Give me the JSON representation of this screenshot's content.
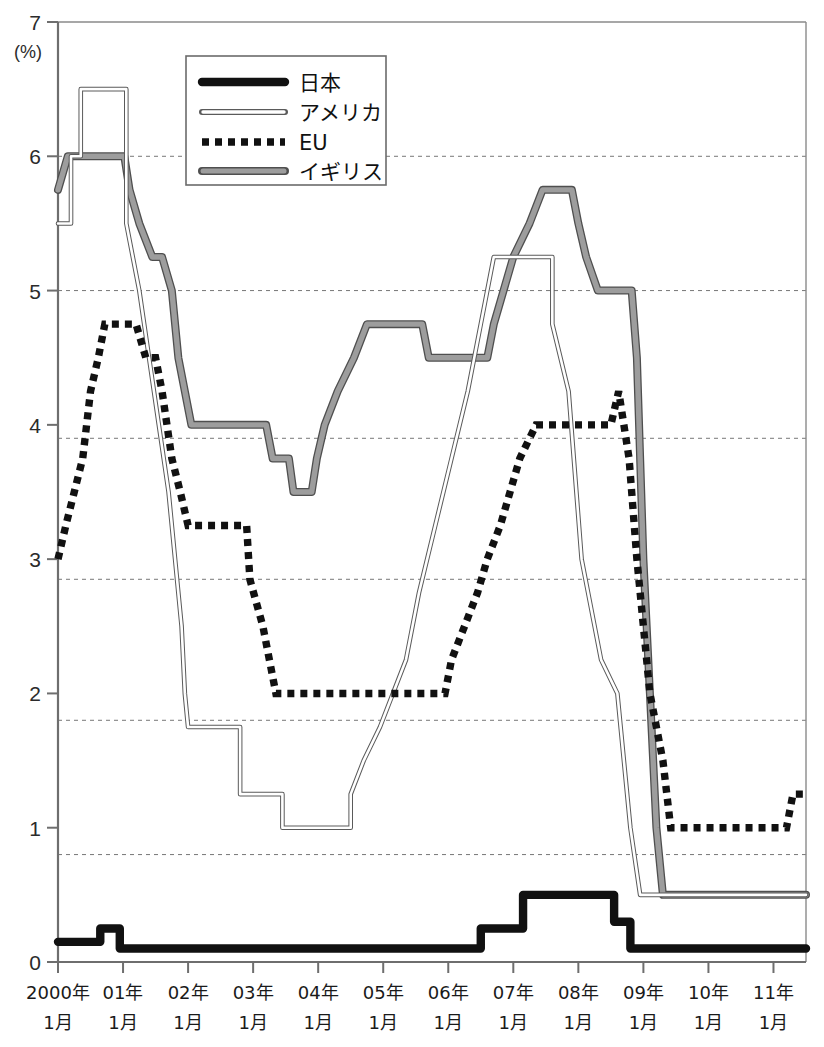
{
  "chart_data": {
    "type": "line",
    "title": "",
    "subtitle": "",
    "xlabel": "",
    "ylabel": "",
    "unit_label": "(%)",
    "ylim": [
      0,
      7
    ],
    "yticks": [
      0,
      1,
      2,
      3,
      4,
      5,
      6,
      7
    ],
    "ytick_labels": [
      "0",
      "1",
      "2",
      "3",
      "4",
      "5",
      "6",
      "7"
    ],
    "grid": "horizontal dashed at 0.8, 1.8, 2.85, 3.9, 5.0, 6.0",
    "gridlines": [
      0.8,
      1.8,
      2.85,
      3.9,
      5.0,
      6.0
    ],
    "legend_position": "top-center-left",
    "xlim": [
      2000.0,
      2011.5
    ],
    "xticks": [
      2000,
      2001,
      2002,
      2003,
      2004,
      2005,
      2006,
      2007,
      2008,
      2009,
      2010,
      2011
    ],
    "categories": [
      "2000年\n1月",
      "01年\n1月",
      "02年\n1月",
      "03年\n1月",
      "04年\n1月",
      "05年\n1月",
      "06年\n1月",
      "07年\n1月",
      "08年\n1月",
      "09年\n1月",
      "10年\n1月",
      "11年\n1月"
    ],
    "xtick_labels_line1": [
      "2000年",
      "01年",
      "02年",
      "03年",
      "04年",
      "05年",
      "06年",
      "07年",
      "08年",
      "09年",
      "10年",
      "11年"
    ],
    "xtick_labels_line2": [
      "1月",
      "1月",
      "1月",
      "1月",
      "1月",
      "1月",
      "1月",
      "1月",
      "1月",
      "1月",
      "1月",
      "1月"
    ],
    "series": [
      {
        "name": "日本",
        "style": "thick-black-solid",
        "color": "#1a1a1a",
        "points": [
          [
            2000.0,
            0.15
          ],
          [
            2000.65,
            0.15
          ],
          [
            2000.65,
            0.25
          ],
          [
            2000.95,
            0.25
          ],
          [
            2000.95,
            0.1
          ],
          [
            2006.5,
            0.1
          ],
          [
            2006.5,
            0.25
          ],
          [
            2007.15,
            0.25
          ],
          [
            2007.15,
            0.5
          ],
          [
            2008.55,
            0.5
          ],
          [
            2008.55,
            0.3
          ],
          [
            2008.8,
            0.3
          ],
          [
            2008.8,
            0.1
          ],
          [
            2011.5,
            0.1
          ]
        ]
      },
      {
        "name": "アメリカ",
        "style": "thin-outlined-white",
        "color": "#ffffff",
        "points": [
          [
            2000.0,
            5.5
          ],
          [
            2000.2,
            5.5
          ],
          [
            2000.2,
            6.0
          ],
          [
            2000.35,
            6.0
          ],
          [
            2000.35,
            6.5
          ],
          [
            2001.05,
            6.5
          ],
          [
            2001.05,
            5.5
          ],
          [
            2001.25,
            5.0
          ],
          [
            2001.4,
            4.5
          ],
          [
            2001.55,
            4.0
          ],
          [
            2001.7,
            3.5
          ],
          [
            2001.8,
            3.0
          ],
          [
            2001.9,
            2.5
          ],
          [
            2001.95,
            2.0
          ],
          [
            2002.0,
            1.75
          ],
          [
            2002.8,
            1.75
          ],
          [
            2002.8,
            1.25
          ],
          [
            2003.45,
            1.25
          ],
          [
            2003.45,
            1.0
          ],
          [
            2004.5,
            1.0
          ],
          [
            2004.5,
            1.25
          ],
          [
            2004.7,
            1.5
          ],
          [
            2004.95,
            1.75
          ],
          [
            2005.15,
            2.0
          ],
          [
            2005.35,
            2.25
          ],
          [
            2005.55,
            2.75
          ],
          [
            2005.8,
            3.25
          ],
          [
            2006.05,
            3.75
          ],
          [
            2006.3,
            4.25
          ],
          [
            2006.5,
            4.75
          ],
          [
            2006.7,
            5.25
          ],
          [
            2007.6,
            5.25
          ],
          [
            2007.6,
            4.75
          ],
          [
            2007.85,
            4.25
          ],
          [
            2008.05,
            3.0
          ],
          [
            2008.35,
            2.25
          ],
          [
            2008.6,
            2.0
          ],
          [
            2008.8,
            1.0
          ],
          [
            2008.95,
            0.5
          ],
          [
            2011.5,
            0.5
          ]
        ]
      },
      {
        "name": "EU",
        "style": "thick-black-dotted",
        "color": "#111111",
        "points": [
          [
            2000.0,
            3.0
          ],
          [
            2000.12,
            3.25
          ],
          [
            2000.25,
            3.5
          ],
          [
            2000.38,
            3.75
          ],
          [
            2000.5,
            4.25
          ],
          [
            2000.62,
            4.5
          ],
          [
            2000.72,
            4.75
          ],
          [
            2001.2,
            4.75
          ],
          [
            2001.35,
            4.5
          ],
          [
            2001.5,
            4.5
          ],
          [
            2001.6,
            4.25
          ],
          [
            2001.75,
            3.75
          ],
          [
            2001.88,
            3.5
          ],
          [
            2002.0,
            3.25
          ],
          [
            2002.9,
            3.25
          ],
          [
            2002.95,
            2.85
          ],
          [
            2003.15,
            2.5
          ],
          [
            2003.35,
            2.0
          ],
          [
            2005.95,
            2.0
          ],
          [
            2006.05,
            2.25
          ],
          [
            2006.25,
            2.5
          ],
          [
            2006.45,
            2.75
          ],
          [
            2006.6,
            3.0
          ],
          [
            2006.8,
            3.25
          ],
          [
            2006.95,
            3.5
          ],
          [
            2007.1,
            3.75
          ],
          [
            2007.35,
            4.0
          ],
          [
            2008.5,
            4.0
          ],
          [
            2008.62,
            4.25
          ],
          [
            2008.78,
            3.75
          ],
          [
            2008.9,
            3.0
          ],
          [
            2009.0,
            2.5
          ],
          [
            2009.1,
            2.0
          ],
          [
            2009.3,
            1.5
          ],
          [
            2009.42,
            1.0
          ],
          [
            2011.2,
            1.0
          ],
          [
            2011.3,
            1.25
          ],
          [
            2011.5,
            1.25
          ]
        ]
      },
      {
        "name": "イギリス",
        "style": "thick-gray-solid",
        "color": "#8e8e8e",
        "points": [
          [
            2000.0,
            5.75
          ],
          [
            2000.15,
            6.0
          ],
          [
            2001.02,
            6.0
          ],
          [
            2001.1,
            5.75
          ],
          [
            2001.25,
            5.5
          ],
          [
            2001.45,
            5.25
          ],
          [
            2001.6,
            5.25
          ],
          [
            2001.75,
            5.0
          ],
          [
            2001.85,
            4.5
          ],
          [
            2001.95,
            4.25
          ],
          [
            2002.05,
            4.0
          ],
          [
            2003.2,
            4.0
          ],
          [
            2003.3,
            3.75
          ],
          [
            2003.55,
            3.75
          ],
          [
            2003.62,
            3.5
          ],
          [
            2003.9,
            3.5
          ],
          [
            2003.98,
            3.75
          ],
          [
            2004.1,
            4.0
          ],
          [
            2004.3,
            4.25
          ],
          [
            2004.55,
            4.5
          ],
          [
            2004.75,
            4.75
          ],
          [
            2005.6,
            4.75
          ],
          [
            2005.7,
            4.5
          ],
          [
            2006.6,
            4.5
          ],
          [
            2006.7,
            4.75
          ],
          [
            2006.85,
            5.0
          ],
          [
            2007.0,
            5.25
          ],
          [
            2007.25,
            5.5
          ],
          [
            2007.45,
            5.75
          ],
          [
            2007.9,
            5.75
          ],
          [
            2008.0,
            5.5
          ],
          [
            2008.12,
            5.25
          ],
          [
            2008.3,
            5.0
          ],
          [
            2008.82,
            5.0
          ],
          [
            2008.9,
            4.5
          ],
          [
            2009.0,
            3.0
          ],
          [
            2009.1,
            2.0
          ],
          [
            2009.2,
            1.0
          ],
          [
            2009.3,
            0.5
          ],
          [
            2011.5,
            0.5
          ]
        ]
      }
    ]
  },
  "legend": {
    "entries": [
      {
        "label": "日本",
        "swatch": "thick-black-solid"
      },
      {
        "label": "アメリカ",
        "swatch": "thin-outlined-white"
      },
      {
        "label": "EU",
        "swatch": "thick-black-dotted"
      },
      {
        "label": "イギリス",
        "swatch": "thick-gray-solid"
      }
    ]
  },
  "axes": {
    "y_unit": "(%)",
    "y_labels": [
      "7",
      "6",
      "5",
      "4",
      "3",
      "2",
      "1",
      "0"
    ]
  }
}
